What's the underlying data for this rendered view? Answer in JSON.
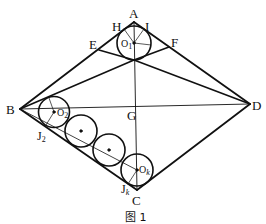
{
  "figure": {
    "caption": "图 1",
    "points": {
      "A": "A",
      "B": "B",
      "C": "C",
      "D": "D",
      "E": "E",
      "F": "F",
      "G": "G",
      "H": "H",
      "I": "I"
    },
    "centers": {
      "O1": {
        "main": "O",
        "sub": "1"
      },
      "O2": {
        "main": "O",
        "sub": "2"
      },
      "Ok": {
        "main": "O",
        "sub": "k"
      }
    },
    "tangent_points": {
      "J2": {
        "main": "J",
        "sub": "2"
      },
      "Jk": {
        "main": "J",
        "sub": "k"
      }
    }
  }
}
